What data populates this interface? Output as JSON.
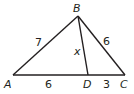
{
  "diagram": {
    "type": "triangle",
    "vertices": {
      "A": {
        "label": "A",
        "x": 13,
        "y": 75
      },
      "B": {
        "label": "B",
        "x": 78,
        "y": 16
      },
      "C": {
        "label": "C",
        "x": 125,
        "y": 75
      },
      "D": {
        "label": "D",
        "x": 88,
        "y": 75
      }
    },
    "segments": {
      "AB": {
        "label": "7"
      },
      "BC": {
        "label": "6"
      },
      "AD": {
        "label": "6"
      },
      "DC": {
        "label": "3"
      },
      "BD": {
        "label": "x"
      }
    },
    "stroke_color": "#231f20"
  }
}
